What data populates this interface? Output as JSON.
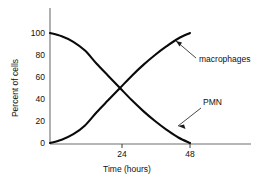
{
  "chart_data": {
    "type": "line",
    "title": "",
    "xlabel": "Time (hours)",
    "ylabel": "Percent of cells",
    "xlim": [
      0,
      60
    ],
    "ylim": [
      0,
      100
    ],
    "xticks": [
      24,
      48
    ],
    "xtick_labels": [
      "24",
      "48"
    ],
    "yticks": [
      0,
      20,
      40,
      60,
      80,
      100
    ],
    "ytick_labels": [
      "0",
      "20",
      "40",
      "60",
      "80",
      "100"
    ],
    "grid": false,
    "legend_position": "inline-annotations",
    "x": [
      0,
      4,
      8,
      12,
      16,
      20,
      24,
      28,
      32,
      36,
      40,
      44,
      48
    ],
    "series": [
      {
        "name": "PMN",
        "label": "PMN",
        "color": "#0a0a0a",
        "values": [
          100,
          97,
          92,
          84,
          72,
          61,
          50,
          39,
          29,
          20,
          12,
          5,
          0
        ]
      },
      {
        "name": "macrophages",
        "label": "macrophages",
        "color": "#0a0a0a",
        "values": [
          0,
          3,
          8,
          16,
          28,
          39,
          50,
          61,
          71,
          80,
          88,
          95,
          100
        ]
      }
    ],
    "annotations": [
      {
        "text": "macrophages",
        "series": "macrophages",
        "x": 40,
        "y": 88
      },
      {
        "text": "PMN",
        "series": "PMN",
        "x": 40,
        "y": 12
      }
    ]
  },
  "axes": {
    "y_title": "Percent of cells",
    "x_title": "Time (hours)",
    "y_labels": [
      "100",
      "80",
      "60",
      "40",
      "20",
      "0"
    ],
    "x_labels": [
      "24",
      "48"
    ]
  },
  "labels": {
    "macrophages": "macrophages",
    "pmn": "PMN"
  }
}
